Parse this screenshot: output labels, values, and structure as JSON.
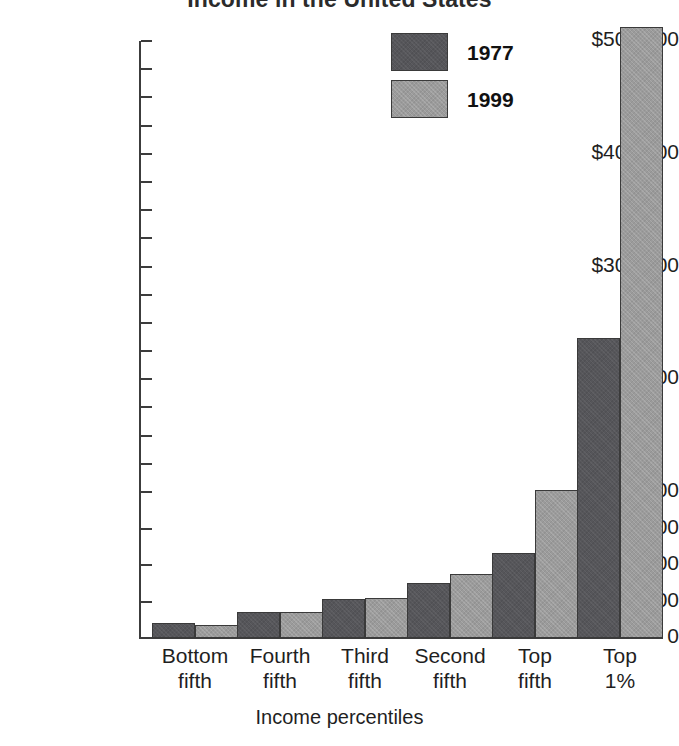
{
  "chart_data": {
    "type": "bar",
    "title": "Income in the United States",
    "xlabel": "Income percentiles",
    "ylabel": "",
    "categories": [
      "Bottom fifth",
      "Fourth fifth",
      "Third fifth",
      "Second fifth",
      "Top fifth",
      "Top 1%"
    ],
    "category_lines": [
      [
        "Bottom",
        "fifth"
      ],
      [
        "Fourth",
        "fifth"
      ],
      [
        "Third",
        "fifth"
      ],
      [
        "Second",
        "fifth"
      ],
      [
        "Top",
        "fifth"
      ],
      [
        "Top",
        "1%"
      ]
    ],
    "series": [
      {
        "name": "1977",
        "color": "#56565a",
        "values": [
          10000,
          17500,
          27000,
          38000,
          58000,
          237000
        ]
      },
      {
        "name": "1999",
        "color": "#9b9b9b",
        "values": [
          8800,
          17500,
          27500,
          44000,
          102000,
          512000
        ]
      }
    ],
    "ylim": [
      0,
      500000
    ],
    "y_axis_note": "broken / compressed scale: 0-100,000 region expanded relative to 100,000-500,000",
    "y_ticks_labeled": [
      "$500,000",
      "$400,000",
      "$300,000",
      "$200,000",
      "$100,000",
      "$75,000",
      "$50,000",
      "$25,000",
      "0"
    ],
    "y_tick_values_labeled": [
      500000,
      400000,
      300000,
      200000,
      100000,
      75000,
      50000,
      25000,
      0
    ],
    "y_minor_tick_values": [
      475000,
      450000,
      425000,
      375000,
      350000,
      325000,
      275000,
      250000,
      225000,
      175000,
      150000,
      125000
    ],
    "grid": false,
    "legend_position": "top-center-right"
  },
  "axis": {
    "y_labels": [
      {
        "text": "$500,000",
        "value": 500000
      },
      {
        "text": "$400,000",
        "value": 400000
      },
      {
        "text": "$300,000",
        "value": 300000
      },
      {
        "text": "$200,000",
        "value": 200000
      },
      {
        "text": "$100,000",
        "value": 100000
      },
      {
        "text": "$75,000",
        "value": 75000
      },
      {
        "text": "$50,000",
        "value": 50000
      },
      {
        "text": "$25,000",
        "value": 25000
      },
      {
        "text": "0",
        "value": 0
      }
    ]
  },
  "legend": {
    "items": [
      {
        "label": "1977",
        "color": "#56565a"
      },
      {
        "label": "1999",
        "color": "#9b9b9b"
      }
    ]
  }
}
